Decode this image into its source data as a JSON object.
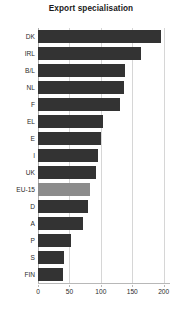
{
  "chart_data": {
    "type": "bar",
    "orientation": "horizontal",
    "title": "Export specialisation",
    "xlabel": "",
    "ylabel": "",
    "categories": [
      "DK",
      "IRL",
      "B/L",
      "NL",
      "F",
      "EL",
      "E",
      "I",
      "UK",
      "EU-15",
      "D",
      "A",
      "P",
      "S",
      "FIN"
    ],
    "values": [
      196,
      164,
      138,
      137,
      130,
      104,
      101,
      95,
      92,
      83,
      79,
      71,
      53,
      42,
      39
    ],
    "xlim": [
      0,
      210
    ],
    "xticks": [
      0,
      50,
      100,
      150,
      200
    ],
    "xticklabels": [
      "0",
      "50",
      "100",
      "150",
      "200"
    ],
    "grid": "vertical",
    "legend": "none",
    "highlight_category": "EU-15",
    "colors": {
      "bar": "#333333",
      "highlight_bar": "#8c8c8c",
      "gridline": "#d6d6d6",
      "axis": "#b8b8b8",
      "text": "#2b2b2b",
      "background": "#ffffff"
    }
  }
}
